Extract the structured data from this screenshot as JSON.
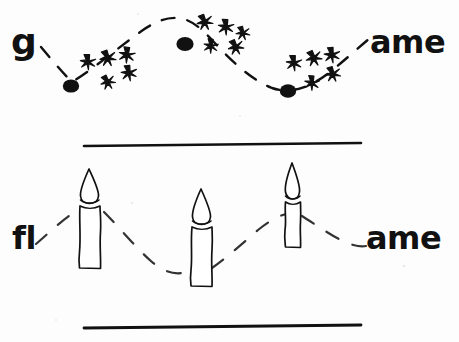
{
  "page": {
    "width": 459,
    "height": 342,
    "background_color": "#fdfdfd",
    "ink_color": "#111111"
  },
  "panels": [
    {
      "id": "top-panel",
      "name": "game-panel",
      "word": "game",
      "prefix_label": "g",
      "suffix_label": "ame",
      "pictograph": "sparks-and-dots",
      "description": "dashed wavy line linking three clusters of black dots with asterisk sparkles",
      "cluster_count": 3,
      "dot_count": 3,
      "asterisks_per_cluster": 5,
      "has_rules": false
    },
    {
      "id": "bottom-panel",
      "name": "flame-panel",
      "word": "flame",
      "prefix_label": "fl",
      "suffix_label": "ame",
      "pictograph": "candles",
      "description": "dashed wavy line linking three lit candles, framed by two horizontal rules",
      "candle_count": 3,
      "has_rules": true,
      "rule_top_y": 145,
      "rule_bottom_y": 327
    }
  ],
  "top_panel": {
    "prefix": "g",
    "suffix": "ame",
    "clusters": [
      {
        "index": 1,
        "dot": {
          "cx": 71,
          "cy": 86,
          "rx": 8,
          "ry": 6.5
        },
        "asterisk_count": 5
      },
      {
        "index": 2,
        "dot": {
          "cx": 185,
          "cy": 44,
          "rx": 8.5,
          "ry": 7
        },
        "asterisk_count": 5
      },
      {
        "index": 3,
        "dot": {
          "cx": 288,
          "cy": 91,
          "rx": 8,
          "ry": 6.5
        },
        "asterisk_count": 5
      }
    ]
  },
  "bottom_panel": {
    "prefix": "fl",
    "suffix": "ame",
    "candles": [
      {
        "index": 1,
        "x": 89,
        "flame_tip_y": 170,
        "body_top_y": 196,
        "body_bottom_y": 269,
        "body_width": 22
      },
      {
        "index": 2,
        "x": 201,
        "flame_tip_y": 190,
        "body_top_y": 217,
        "body_bottom_y": 287,
        "body_width": 22
      },
      {
        "index": 3,
        "x": 292,
        "flame_tip_y": 164,
        "body_top_y": 192,
        "body_bottom_y": 247,
        "body_width": 17
      }
    ],
    "rules": [
      {
        "name": "upper-rule",
        "x1": 84,
        "y1": 146,
        "x2": 361,
        "y2": 143
      },
      {
        "name": "lower-rule",
        "x1": 84,
        "y1": 328,
        "x2": 361,
        "y2": 325
      }
    ]
  }
}
